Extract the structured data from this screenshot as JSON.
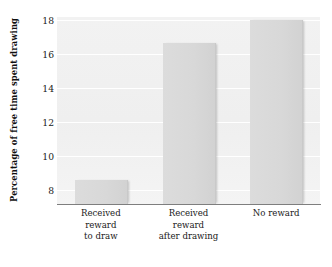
{
  "chart_data": {
    "type": "bar",
    "title": "",
    "xlabel": "",
    "ylabel": "Percentage of free time spent drawing",
    "categories": [
      "Received reward to draw",
      "Received reward after drawing",
      "No reward"
    ],
    "category_lines": [
      [
        "Received",
        "reward",
        "to draw"
      ],
      [
        "Received",
        "reward",
        "after drawing"
      ],
      [
        "No reward"
      ]
    ],
    "values": [
      8.6,
      16.7,
      18.0
    ],
    "ylim": [
      7.2,
      18.2
    ],
    "yticks": [
      8,
      10,
      12,
      14,
      16,
      18
    ],
    "ytick_labels": [
      "8",
      "10",
      "12",
      "14",
      "16",
      "18"
    ],
    "grid": true,
    "legend": null,
    "bar_color": "#d8d8d8",
    "plot_background": "#f1f1f1",
    "axis_color": "#7e7e7e",
    "gridline_color": "#ffffff"
  }
}
